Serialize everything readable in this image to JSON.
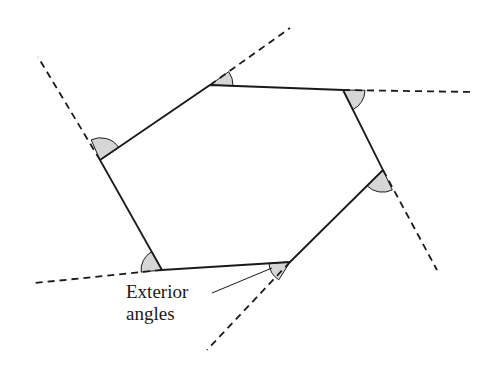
{
  "diagram": {
    "label_lines": [
      "Exterior",
      "angles"
    ],
    "colors": {
      "stroke": "#1a1a1a",
      "angle_fill": "#d6d6d6",
      "background": "#ffffff"
    },
    "vertices": [
      {
        "name": "top-left",
        "x": 210,
        "y": 85
      },
      {
        "name": "top-right",
        "x": 343,
        "y": 90
      },
      {
        "name": "right",
        "x": 383,
        "y": 170
      },
      {
        "name": "bottom-right",
        "x": 290,
        "y": 262
      },
      {
        "name": "bottom-left",
        "x": 162,
        "y": 270
      },
      {
        "name": "left",
        "x": 100,
        "y": 160
      }
    ],
    "extensions": [
      {
        "from": "top-left",
        "to": [
          290,
          28
        ]
      },
      {
        "from": "top-right",
        "to": [
          473,
          92
        ]
      },
      {
        "from": "right",
        "to": [
          437,
          270
        ]
      },
      {
        "from": "bottom-right",
        "to": [
          207,
          350
        ]
      },
      {
        "from": "bottom-left",
        "to": [
          35,
          283
        ]
      },
      {
        "from": "left",
        "to": [
          38,
          57
        ]
      }
    ],
    "angle_markers": 6
  }
}
